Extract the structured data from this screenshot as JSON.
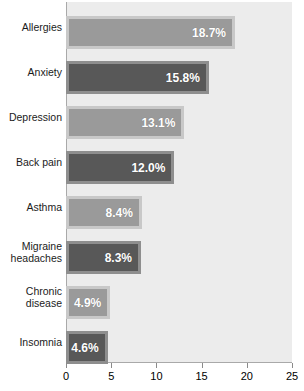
{
  "chart_data": {
    "type": "bar",
    "orientation": "horizontal",
    "title": "",
    "xlabel": "",
    "ylabel": "",
    "xlim": [
      0,
      25
    ],
    "xticks": [
      0,
      5,
      10,
      15,
      20,
      25
    ],
    "xtick_labels": [
      "0",
      "5",
      "10",
      "15",
      "20",
      "25"
    ],
    "grid": false,
    "legend": "none",
    "categories": [
      "Allergies",
      "Anxiety",
      "Depression",
      "Back pain",
      "Asthma",
      "Migraine\nheadaches",
      "Chronic\ndisease",
      "Insomnia"
    ],
    "values": [
      18.7,
      15.8,
      13.1,
      12.0,
      8.4,
      8.3,
      4.9,
      4.6
    ],
    "value_labels": [
      "18.7%",
      "15.8%",
      "13.1%",
      "12.0%",
      "8.4%",
      "8.3%",
      "4.9%",
      "4.6%"
    ],
    "bar_styles": [
      "light",
      "dark",
      "light",
      "dark",
      "light",
      "dark",
      "light",
      "dark"
    ],
    "colors": {
      "bar_light_fill": "#9a9a9a",
      "bar_light_border": "#c8c8c8",
      "bar_dark_fill": "#585858",
      "bar_dark_border": "#8e8e8e",
      "plot_background": "#ececec",
      "axis_line": "#a9a9a9",
      "value_text": "#ffffff",
      "category_text": "#1b1b1b"
    }
  }
}
